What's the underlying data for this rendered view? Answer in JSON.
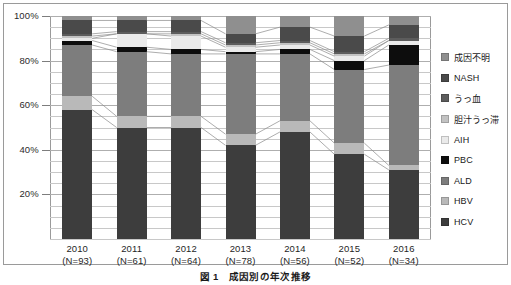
{
  "figure": {
    "caption": "図 1　成因別の年次推移"
  },
  "chart_data": {
    "type": "bar",
    "stacked": true,
    "normalized": "100% stacked",
    "title": "図 1　成因別の年次推移",
    "xlabel": "",
    "ylabel": "",
    "ylim": [
      0,
      100
    ],
    "yticks": [
      20,
      40,
      60,
      80,
      100
    ],
    "ytick_labels": [
      "20%",
      "40%",
      "60%",
      "80%",
      "100%"
    ],
    "minor_gridline_step": 5,
    "grid": true,
    "legend_position": "right",
    "categories": [
      "2010",
      "2011",
      "2012",
      "2013",
      "2014",
      "2015",
      "2016"
    ],
    "category_labels": [
      {
        "year": "2010",
        "n": "(N=93)"
      },
      {
        "year": "2011",
        "n": "(N=61)"
      },
      {
        "year": "2012",
        "n": "(N=64)"
      },
      {
        "year": "2013",
        "n": "(N=78)"
      },
      {
        "year": "2014",
        "n": "(N=56)"
      },
      {
        "year": "2015",
        "n": "(N=52)"
      },
      {
        "year": "2016",
        "n": "(N=34)"
      }
    ],
    "stack_order_bottom_to_top": [
      "HCV",
      "HBV",
      "ALD",
      "PBC",
      "AIH",
      "胆汁うっ滞",
      "うっ血",
      "NASH",
      "成因不明"
    ],
    "series": [
      {
        "name": "HCV",
        "color": "#3d3d3d",
        "values": [
          58,
          50,
          50,
          42,
          48,
          38,
          31
        ]
      },
      {
        "name": "HBV",
        "color": "#b9b9b9",
        "values": [
          6,
          5,
          5,
          5,
          5,
          5,
          2
        ]
      },
      {
        "name": "ALD",
        "color": "#7d7d7d",
        "values": [
          23,
          29,
          28,
          36,
          30,
          33,
          45
        ]
      },
      {
        "name": "PBC",
        "color": "#0d0d0d",
        "values": [
          2,
          2,
          2,
          1,
          2,
          4,
          9
        ]
      },
      {
        "name": "AIH",
        "color": "#eaeaea",
        "values": [
          1,
          6,
          6,
          2,
          2,
          2,
          2
        ]
      },
      {
        "name": "胆汁うっ滞",
        "color": "#c2c2c2",
        "values": [
          1,
          0,
          1,
          1,
          1,
          1,
          0
        ]
      },
      {
        "name": "うっ血",
        "color": "#5c5c5c",
        "values": [
          1,
          1,
          1,
          1,
          1,
          1,
          1
        ]
      },
      {
        "name": "NASH",
        "color": "#4a4a4a",
        "values": [
          6,
          5,
          5,
          4,
          6,
          7,
          6
        ]
      },
      {
        "name": "成因不明",
        "color": "#8f8f8f",
        "values": [
          2,
          2,
          2,
          8,
          5,
          9,
          4
        ]
      }
    ],
    "legend_entries": [
      {
        "label": "成因不明",
        "color": "#8f8f8f"
      },
      {
        "label": "NASH",
        "color": "#4a4a4a"
      },
      {
        "label": "うっ血",
        "color": "#5c5c5c"
      },
      {
        "label": "胆汁うっ滞",
        "color": "#c2c2c2"
      },
      {
        "label": "AIH",
        "color": "#eaeaea"
      },
      {
        "label": "PBC",
        "color": "#0d0d0d"
      },
      {
        "label": "ALD",
        "color": "#7d7d7d"
      },
      {
        "label": "HBV",
        "color": "#b9b9b9"
      },
      {
        "label": "HCV",
        "color": "#3d3d3d"
      }
    ]
  }
}
